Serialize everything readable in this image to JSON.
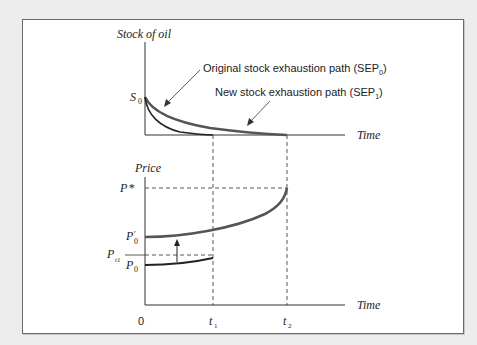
{
  "top_panel": {
    "y_label": "Stock of oil",
    "x_label": "Time",
    "y_tick": "S",
    "y_tick_sub": "0",
    "annotations": [
      {
        "text": "Original stock exhaustion path (SEP",
        "sub": "0",
        "close": ")"
      },
      {
        "text": "New stock exhaustion path (SEP",
        "sub": "1",
        "close": ")"
      }
    ]
  },
  "bottom_panel": {
    "y_label": "Price",
    "x_label": "Time",
    "y_ticks": [
      {
        "main": "P",
        "sup": "*",
        "sub": ""
      },
      {
        "main": "P",
        "sup": "′",
        "sub": "0"
      },
      {
        "main": "P",
        "sup": "",
        "sub": "t1"
      },
      {
        "main": "P",
        "sup": "",
        "sub": "0"
      }
    ],
    "x_ticks": [
      {
        "main": "0",
        "sub": ""
      },
      {
        "main": "t",
        "sub": "1"
      },
      {
        "main": "t",
        "sub": "2"
      }
    ]
  },
  "colors": {
    "sep0_curve": "#555555",
    "sep1_curve": "#222222",
    "axis": "#333333",
    "background": "#ececec",
    "panel": "#ffffff"
  }
}
